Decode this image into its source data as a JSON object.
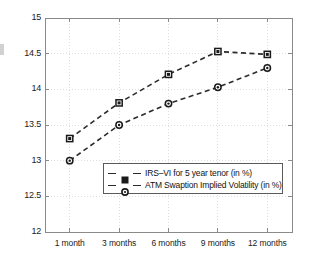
{
  "chart_data": {
    "type": "line",
    "title": "",
    "subtitle": "",
    "xlabel": "",
    "ylabel": "",
    "categories": [
      "1 month",
      "3 months",
      "6 months",
      "9 months",
      "12 months"
    ],
    "series": [
      {
        "name": "IRS–VI for 5 year tenor (in %)",
        "marker": "square",
        "values": [
          13.31,
          13.81,
          14.21,
          14.53,
          14.49
        ]
      },
      {
        "name": "ATM Swaption Implied Volatility (in %)",
        "marker": "circle",
        "values": [
          13.0,
          13.5,
          13.8,
          14.03,
          14.3
        ]
      }
    ],
    "ylim": [
      12,
      15
    ],
    "yticks": [
      "12",
      "12.5",
      "13",
      "13.5",
      "14",
      "14.5",
      "15"
    ],
    "ytick_values": [
      12,
      12.5,
      13,
      13.5,
      14,
      14.5,
      15
    ],
    "grid": true,
    "grid_style": "dotted",
    "legend_position": "lower center",
    "line_style": "dashed",
    "colors": {
      "line": "#2b2b2b",
      "marker": "#1a1a1a",
      "grid": "#d6d6d6",
      "axis": "#8a8a8a",
      "background": "#ffffff"
    }
  },
  "legend": {
    "entries": [
      {
        "label": "IRS–VI for 5 year tenor (in %)",
        "marker": "square-marker"
      },
      {
        "label": "ATM Swaption Implied Volatility (in %)",
        "marker": "circle-marker"
      }
    ]
  }
}
